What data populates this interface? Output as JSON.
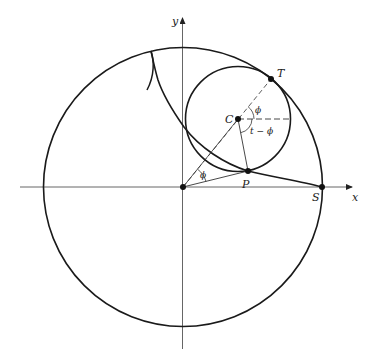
{
  "diagram": {
    "type": "hypocycloid construction",
    "axes": {
      "x_label": "x",
      "y_label": "y"
    },
    "points": {
      "T": "T",
      "C": "C",
      "P": "P",
      "S": "S"
    },
    "angles": {
      "phi_at_C": "ϕ",
      "t_minus_phi": "t − ϕ",
      "phi_at_origin": "ϕ"
    },
    "elements": [
      "large fixed circle centered at origin",
      "small rolling circle centered at C, tangent internally at T",
      "hypocycloid curve from S through P to a cusp",
      "dashed line from origin through C to T",
      "dashed horizontal from C",
      "segment from C to P",
      "segment from origin to P"
    ]
  }
}
